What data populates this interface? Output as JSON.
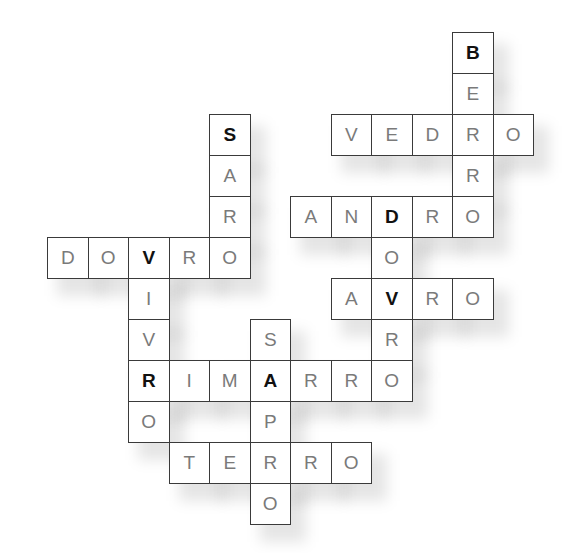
{
  "puzzle": {
    "type": "crossword",
    "grid": {
      "origin_x": 47,
      "origin_y": 32,
      "cell_w": 40.5,
      "cell_h": 41
    },
    "colors": {
      "border": "#3a3a3a",
      "letter": "#7a7a7a",
      "key_letter": "#111111",
      "background": "#ffffff"
    },
    "words": [
      {
        "word": "BERRO",
        "direction": "down",
        "col": 10,
        "row": 0
      },
      {
        "word": "VEDRO",
        "direction": "across",
        "col": 7,
        "row": 2
      },
      {
        "word": "SARO",
        "direction": "down",
        "col": 4,
        "row": 2
      },
      {
        "word": "ANDRO",
        "direction": "across",
        "col": 6,
        "row": 4
      },
      {
        "word": "DOVRO",
        "direction": "across",
        "col": 0,
        "row": 5
      },
      {
        "word": "DOVRO",
        "direction": "down",
        "col": 8,
        "row": 4
      },
      {
        "word": "AVRO",
        "direction": "across",
        "col": 7,
        "row": 6
      },
      {
        "word": "VIVRO",
        "direction": "down",
        "col": 2,
        "row": 5
      },
      {
        "word": "RIMARRO",
        "direction": "across",
        "col": 2,
        "row": 8
      },
      {
        "word": "SAPRO",
        "direction": "down",
        "col": 5,
        "row": 7
      },
      {
        "word": "TERRO",
        "direction": "across",
        "col": 3,
        "row": 10
      }
    ],
    "key_letters": [
      {
        "letter": "B",
        "col": 10,
        "row": 0
      },
      {
        "letter": "S",
        "col": 4,
        "row": 2
      },
      {
        "letter": "D",
        "col": 8,
        "row": 4
      },
      {
        "letter": "V",
        "col": 2,
        "row": 5
      },
      {
        "letter": "V",
        "col": 8,
        "row": 6
      },
      {
        "letter": "R",
        "col": 2,
        "row": 8
      },
      {
        "letter": "A",
        "col": 5,
        "row": 8
      }
    ]
  }
}
